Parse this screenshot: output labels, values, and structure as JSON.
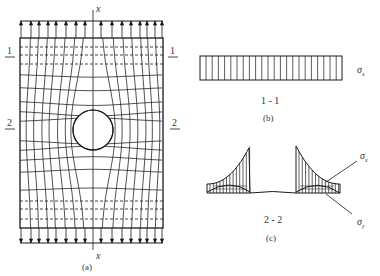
{
  "figure_a": {
    "caption": "(a)",
    "axis_top_label": "x",
    "axis_bottom_label": "x",
    "section_1_left": "1",
    "section_1_right": "1",
    "section_2_left": "2",
    "section_2_right": "2"
  },
  "figure_b": {
    "caption": "(b)",
    "section_label": "1 - 1",
    "stress_label": "σ",
    "stress_subscript": "x"
  },
  "figure_c": {
    "caption": "(c)",
    "section_label": "2 - 2",
    "stress_x_label": "σ",
    "stress_x_subscript": "x",
    "stress_y_label": "σ",
    "stress_y_subscript": "y"
  },
  "colors": {
    "line": "#1a1a1a",
    "text": "#333333",
    "background": "#ffffff"
  }
}
